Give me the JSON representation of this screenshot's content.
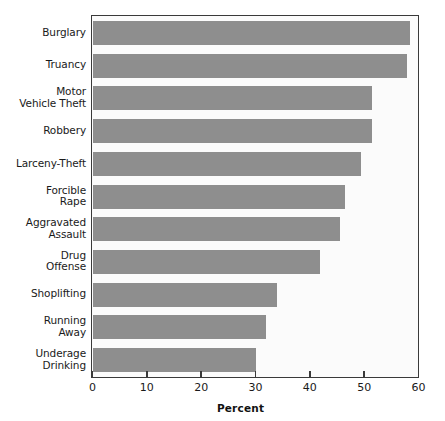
{
  "chart_data": {
    "type": "bar",
    "orientation": "horizontal",
    "title": "",
    "xlabel": "Percent",
    "ylabel": "",
    "xlim": [
      0,
      60
    ],
    "xticks": [
      0,
      10,
      20,
      30,
      40,
      50,
      60
    ],
    "xtick_labels": [
      "0",
      "10",
      "20",
      "30",
      "40",
      "50",
      "60"
    ],
    "grid": false,
    "legend": null,
    "bar_color": "#8e8e8e",
    "categories": [
      "Burglary",
      "Truancy",
      "Motor Vehicle Theft",
      "Robbery",
      "Larceny-Theft",
      "Forcible Rape",
      "Aggravated Assault",
      "Drug Offense",
      "Shoplifting",
      "Running Away",
      "Underage Drinking"
    ],
    "values": [
      58.5,
      57.8,
      51.5,
      51.5,
      49.5,
      46.4,
      45.5,
      41.8,
      33.9,
      32.0,
      30.0
    ]
  },
  "categories_display": [
    {
      "lines": [
        "Burglary"
      ]
    },
    {
      "lines": [
        "Truancy"
      ]
    },
    {
      "lines": [
        "Motor",
        "Vehicle Theft"
      ]
    },
    {
      "lines": [
        "Robbery"
      ]
    },
    {
      "lines": [
        "Larceny-Theft"
      ]
    },
    {
      "lines": [
        "Forcible",
        "Rape"
      ]
    },
    {
      "lines": [
        "Aggravated",
        "Assault"
      ]
    },
    {
      "lines": [
        "Drug",
        "Offense"
      ]
    },
    {
      "lines": [
        "Shoplifting"
      ]
    },
    {
      "lines": [
        "Running",
        "Away"
      ]
    },
    {
      "lines": [
        "Underage",
        "Drinking"
      ]
    }
  ]
}
